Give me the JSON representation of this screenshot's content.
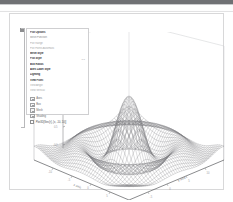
{
  "window": {
    "toolbar_title": ""
  },
  "panel": {
    "rows": [
      {
        "kind": "head",
        "label": "Plot Options",
        "value": ""
      },
      {
        "kind": "sub",
        "label": "Mesh Function",
        "value": ""
      },
      {
        "kind": "dim",
        "label": "Plot Range",
        "value": ""
      },
      {
        "kind": "dim",
        "label": "Plot Points  Automatic",
        "value": ""
      },
      {
        "kind": "head",
        "label": "Mesh Style",
        "value": ""
      },
      {
        "kind": "head",
        "label": "Plot Style",
        "value": "1.0"
      },
      {
        "kind": "head",
        "label": "Box Ratios",
        "value": ""
      },
      {
        "kind": "head",
        "label": "Axes Label Style",
        "value": ""
      },
      {
        "kind": "head",
        "label": "Lighting",
        "value": ""
      },
      {
        "kind": "head",
        "label": "View Point",
        "value": ""
      },
      {
        "kind": "dim",
        "label": "View Angle",
        "value": ""
      },
      {
        "kind": "dim",
        "label": "View Vertical",
        "value": ""
      }
    ],
    "icon_rows": [
      {
        "icon": "axes-icon",
        "label": "Axes"
      },
      {
        "icon": "box-icon",
        "label": "Box"
      },
      {
        "icon": "mesh-icon",
        "label": "Mesh"
      },
      {
        "icon": "shading-icon",
        "label": "Shading"
      }
    ],
    "footer": {
      "checkbox_icon": "checkbox-icon",
      "label": "Plot3D[Sinc[r], {x, -10, 10}]"
    }
  },
  "chart_data": {
    "type": "surface",
    "title": "",
    "xlabel": "x  axis",
    "ylabel": "y  axis",
    "zlabel": "",
    "function": "sinc",
    "xlim": [
      -10,
      10
    ],
    "ylim": [
      -10,
      10
    ],
    "zlim": [
      -0.3,
      1.0
    ],
    "grid": true,
    "legend": false,
    "x_ticks": [
      "-10",
      "-5",
      "0",
      "5",
      "10"
    ],
    "y_ticks": [
      "-10",
      "-5",
      "0",
      "5",
      "10"
    ],
    "z_ticks": [
      "1.0",
      "0.5",
      "0.0"
    ],
    "style": {
      "mesh_color": "#77787a",
      "box_color": "#c6c7c9",
      "axis_color": "#4b4c4e"
    }
  }
}
